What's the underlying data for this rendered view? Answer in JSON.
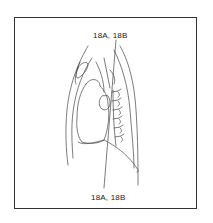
{
  "figure": {
    "type": "anatomical line drawing",
    "section_label_top": "18A, 18B",
    "section_label_bottom": "18A, 18B",
    "colors": {
      "line": "#444444",
      "frame": "#333333",
      "background": "#ffffff"
    }
  }
}
